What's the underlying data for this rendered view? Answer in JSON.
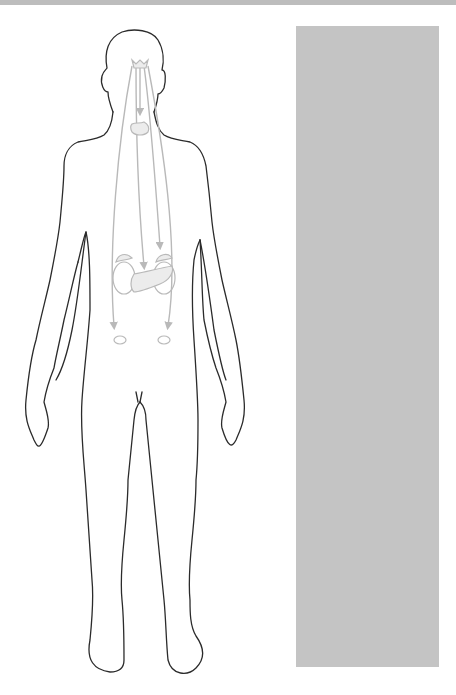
{
  "diagram": {
    "type": "anatomical-outline",
    "colors": {
      "background": "#ffffff",
      "top_strip": "#bdbdbd",
      "body_outline": "#2b2b2b",
      "gland_and_arrow": "#b9b9b9",
      "gland_fill": "#ececec",
      "label_panel": "#c4c4c4"
    },
    "glands": [
      {
        "id": "pituitary-hypothalamus",
        "shape": "small-cluster-in-head"
      },
      {
        "id": "thyroid",
        "shape": "bow-tie-in-neck"
      },
      {
        "id": "adrenal-left",
        "shape": "cap-over-kidney"
      },
      {
        "id": "adrenal-right",
        "shape": "cap-over-kidney"
      },
      {
        "id": "pancreas",
        "shape": "elongated-blob"
      },
      {
        "id": "gonad-left",
        "shape": "small-oval"
      },
      {
        "id": "gonad-right",
        "shape": "small-oval"
      }
    ],
    "arrows": [
      {
        "from": "pituitary-hypothalamus",
        "to": "thyroid"
      },
      {
        "from": "pituitary-hypothalamus",
        "to": "adrenal-right"
      },
      {
        "from": "pituitary-hypothalamus",
        "to": "pancreas"
      },
      {
        "from": "pituitary-hypothalamus",
        "to": "gonad-left"
      },
      {
        "from": "pituitary-hypothalamus",
        "to": "gonad-right"
      }
    ],
    "label_panel": {
      "text": ""
    }
  }
}
